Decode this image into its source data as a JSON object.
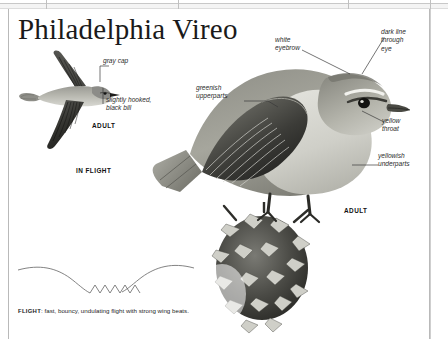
{
  "page": {
    "title": "Philadelphia Vireo",
    "background_color": "#ffffff",
    "frame_color": "#b9b9b9",
    "text_color": "#1a1a1a"
  },
  "callouts": [
    {
      "id": "gray-cap",
      "text": "gray cap"
    },
    {
      "id": "slightly-hooked-black-bill",
      "text": "slightly hooked,\nblack bill"
    },
    {
      "id": "greenish-upperparts",
      "text": "greenish\nupperparts"
    },
    {
      "id": "white-eyebrow",
      "text": "white\neyebrow"
    },
    {
      "id": "dark-line-through-eye",
      "text": "dark line\nthrough\neye"
    },
    {
      "id": "yellow-throat",
      "text": "yellow\nthroat"
    },
    {
      "id": "yellowish-underparts",
      "text": "yellowish\nunderparts"
    }
  ],
  "plate_captions": {
    "flight_adult": "ADULT",
    "in_flight": "IN FLIGHT",
    "perched_adult": "ADULT"
  },
  "flight_note": {
    "label": "FLIGHT",
    "separator": ": ",
    "text": "fast, bouncy, undulating flight with strong wing beats."
  },
  "artwork": {
    "in_flight_bird": "philadelphia-vireo-in-flight-illustration",
    "perched_bird": "philadelphia-vireo-perched-adult-illustration",
    "perch": "pine-cone-perch-illustration",
    "flight_path": "undulating-flight-path-diagram"
  }
}
